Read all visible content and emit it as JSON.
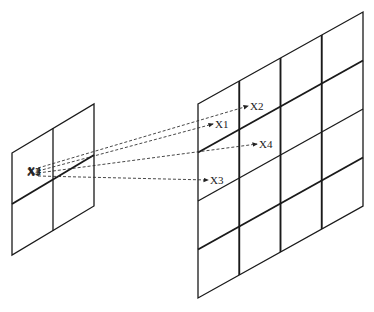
{
  "diagram": {
    "source_grid": {
      "rows": 2,
      "cols": 2
    },
    "target_grid": {
      "rows": 4,
      "cols": 4
    },
    "source_labels": [
      "X1",
      "X2",
      "X3",
      "X4"
    ],
    "arrows": [
      {
        "from": "source",
        "label": "X1"
      },
      {
        "from": "source",
        "label": "X2"
      },
      {
        "from": "source",
        "label": "X3"
      },
      {
        "from": "source",
        "label": "X4"
      }
    ],
    "colors": {
      "line": "#1a1a1a",
      "dash": "#333333",
      "background": "#ffffff"
    }
  }
}
